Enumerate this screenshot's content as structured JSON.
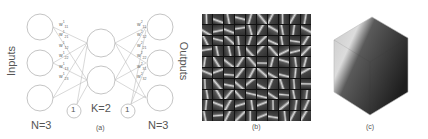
{
  "panel_a": {
    "caption": "(a)",
    "inputs_label": "Inputs",
    "outputs_label": "Outputs",
    "input_count_label": "N=3",
    "hidden_count_label": "K=2",
    "output_count_label": "N=3",
    "bias_left": "1",
    "bias_right": "1",
    "input_nodes": 3,
    "hidden_nodes": 2,
    "output_nodes": 3,
    "left_weights": [
      "w",
      "w",
      "w",
      "w",
      "w",
      "w"
    ],
    "left_weight_sup": [
      "1",
      "1",
      "1",
      "1",
      "1",
      "1"
    ],
    "left_weight_sub": [
      "11",
      "21",
      "12",
      "22",
      "13",
      "23"
    ],
    "right_weights": [
      "w",
      "w",
      "w",
      "w",
      "w",
      "w"
    ],
    "right_weight_sup": [
      "2",
      "2",
      "2",
      "2",
      "2",
      "2"
    ],
    "right_weight_sub": [
      "11",
      "12",
      "21",
      "22",
      "31",
      "32"
    ]
  },
  "panel_b": {
    "caption": "(b)",
    "grid_rows": 10,
    "grid_cols": 10,
    "description": "Learned filters / receptive fields visualized as grayscale patches"
  },
  "panel_c": {
    "caption": "(c)",
    "description": "3D cube visualization, grayscale density"
  },
  "colors": {
    "line": "#aaaaaa",
    "circle": "#b5b5b5",
    "text": "#555555",
    "grid_bg": "#111111"
  }
}
